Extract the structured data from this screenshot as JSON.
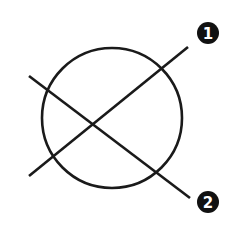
{
  "diagram": {
    "colors": {
      "stroke": "#1a1a1a",
      "badge_fill": "#111111",
      "badge_text": "#ffffff",
      "background": "#ffffff"
    },
    "circle": {
      "cx": 112,
      "cy": 118,
      "r": 70
    },
    "lines": [
      {
        "id": "line-1",
        "x1": 29,
        "y1": 176,
        "x2": 188,
        "y2": 47,
        "label": "1"
      },
      {
        "id": "line-2",
        "x1": 29,
        "y1": 76,
        "x2": 190,
        "y2": 198,
        "label": "2"
      }
    ],
    "badges": [
      {
        "id": "badge-1",
        "cx": 208,
        "cy": 33,
        "r": 11,
        "label": "1"
      },
      {
        "id": "badge-2",
        "cx": 208,
        "cy": 202,
        "r": 11,
        "label": "2"
      }
    ]
  }
}
